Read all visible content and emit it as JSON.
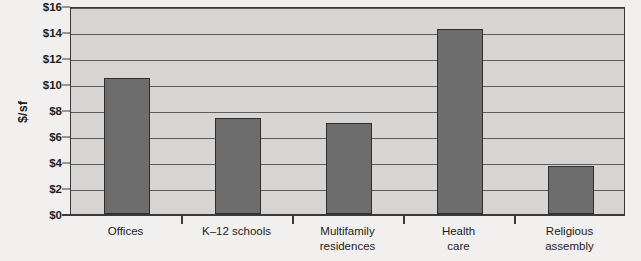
{
  "chart_data": {
    "type": "bar",
    "title": "",
    "subtitle": "",
    "xlabel": "",
    "ylabel": "$/sf",
    "ylim": [
      0,
      16
    ],
    "ytick_values": [
      0,
      2,
      4,
      6,
      8,
      10,
      12,
      14,
      16
    ],
    "ytick_labels": [
      "$0",
      "$2",
      "$4",
      "$6",
      "$8",
      "$10",
      "$12",
      "$14",
      "$16"
    ],
    "grid": true,
    "legend": "none",
    "categories": [
      "Offices",
      "K–12 schools",
      "Multifamily\nresidences",
      "Health\ncare",
      "Religious\nassembly"
    ],
    "category_lines": [
      [
        "Offices"
      ],
      [
        "K–12 schools"
      ],
      [
        "Multifamily",
        "residences"
      ],
      [
        "Health",
        "care"
      ],
      [
        "Religious",
        "assembly"
      ]
    ],
    "values": [
      10.5,
      7.4,
      7.0,
      14.2,
      3.7
    ],
    "colors": {
      "bar_fill": "#6d6d6d",
      "bar_border": "#2e2e2e",
      "plot_background": "#d6d5d3",
      "gridline": "#5c5c5c",
      "axis": "#3a3a3a",
      "page_background": "#f2f0ee",
      "text": "#1d1d1d"
    }
  }
}
